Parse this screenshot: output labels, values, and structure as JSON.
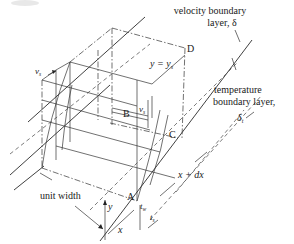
{
  "figure": {
    "labels": {
      "velocity_bl_line1": "velocity boundary",
      "velocity_bl_line2": "layer, δ",
      "temperature_bl_line1": "temperature",
      "temperature_bl_line2": "boundary layer,",
      "temperature_bl_symbol": "δ",
      "temperature_bl_sub": "t",
      "y_eq_ys": "y = y",
      "y_eq_ys_sub": "s",
      "point_A": "A",
      "point_B": "B",
      "point_C": "C",
      "point_D": "D",
      "vs_left": "v",
      "vs_left_sub": "s",
      "vs_mid": "v",
      "vs_mid_sub": "s",
      "unit_width": "unit width",
      "y_axis": "y",
      "x_axis": "x",
      "x_plus_dx": "x + dx",
      "tw": "t",
      "tw_sub": "w",
      "ts": "t",
      "ts_sub": "s"
    }
  }
}
